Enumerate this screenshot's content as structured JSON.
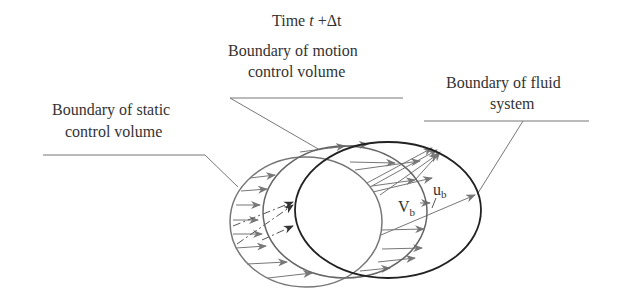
{
  "title": {
    "prefix": "Time ",
    "var": "t",
    "suffix": " +Δt"
  },
  "labels": {
    "motion_cv": [
      "Boundary of motion",
      "control volume"
    ],
    "static_cv": [
      "Boundary of static",
      "control volume"
    ],
    "fluid_system": [
      "Boundary of fluid",
      "system"
    ]
  },
  "symbols": {
    "V": "V",
    "V_sub": "b",
    "u": "u",
    "u_sub": "b"
  },
  "colors": {
    "static_boundary": "#777777",
    "motion_boundary": "#666666",
    "fluid_boundary": "#222222",
    "arrows": "#777777",
    "leaders": "#777777"
  }
}
